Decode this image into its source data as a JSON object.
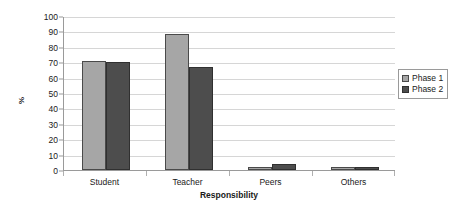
{
  "chart_data": {
    "type": "bar",
    "title": "",
    "xlabel": "Responsibility",
    "ylabel": "%",
    "categories": [
      "Student",
      "Teacher",
      "Peers",
      "Others"
    ],
    "series": [
      {
        "name": "Phase 1",
        "color": "#a6a6a6",
        "values": [
          71,
          88,
          2,
          2
        ]
      },
      {
        "name": "Phase 2",
        "color": "#4d4d4d",
        "values": [
          70,
          67,
          4,
          2
        ]
      }
    ],
    "ylim": [
      0,
      100
    ],
    "yticks": [
      0,
      10,
      20,
      30,
      40,
      50,
      60,
      70,
      80,
      90,
      100
    ],
    "ytick_labels": [
      "0",
      "10",
      "20",
      "30",
      "40",
      "50",
      "60",
      "70",
      "80",
      "90",
      "100"
    ],
    "grid": true,
    "legend_position": "right",
    "legend_entries": [
      "Phase 1",
      "Phase 2"
    ]
  }
}
